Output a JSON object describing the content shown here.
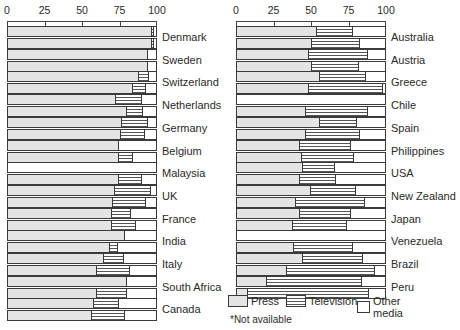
{
  "chart_data": [
    {
      "type": "bar",
      "subtype": "stacked-horizontal-100-percent",
      "title": "",
      "xlabel": "",
      "ylabel": "",
      "xlim": [
        0,
        100
      ],
      "x_ticks": [
        "0",
        "25",
        "50",
        "75",
        "100"
      ],
      "grid": false,
      "note": "Each country has two stacked bars (top and bottom periods); segments: Press, Television, Other media (remainder to 100). null = not available.",
      "series_names": [
        "Press",
        "Television",
        "Other media"
      ],
      "categories": [
        "Denmark",
        "Sweden",
        "Switzerland",
        "Netherlands",
        "Germany",
        "Belgium",
        "Malaysia",
        "UK",
        "France",
        "India",
        "Italy",
        "South Africa",
        "Canada"
      ],
      "rows": [
        {
          "country": "Denmark",
          "top": {
            "press": 96,
            "television": 1,
            "other": 3
          },
          "bottom": {
            "press": 96,
            "television": 1,
            "other": 3
          }
        },
        {
          "country": "Sweden",
          "top": {
            "press": 93,
            "television": 0,
            "other": 7
          },
          "bottom": {
            "press": 93,
            "television": 0,
            "other": 7
          }
        },
        {
          "country": "Switzerland",
          "top": {
            "press": 87,
            "television": 7,
            "other": 6
          },
          "bottom": {
            "press": 83,
            "television": 9,
            "other": 8
          }
        },
        {
          "country": "Netherlands",
          "top": {
            "press": 72,
            "television": 17,
            "other": 11
          },
          "bottom": {
            "press": 79,
            "television": 11,
            "other": 10
          }
        },
        {
          "country": "Germany",
          "top": {
            "press": 76,
            "television": 17,
            "other": 7
          },
          "bottom": {
            "press": 75,
            "television": 16,
            "other": 9
          }
        },
        {
          "country": "Belgium",
          "top": {
            "press": 74,
            "television": 0,
            "other": 26
          },
          "bottom": {
            "press": 74,
            "television": 9,
            "other": 17
          }
        },
        {
          "country": "Malaysia",
          "top": null,
          "bottom": {
            "press": 74,
            "television": 15,
            "other": 11
          }
        },
        {
          "country": "UK",
          "top": {
            "press": 71,
            "television": 24,
            "other": 5
          },
          "bottom": {
            "press": 70,
            "television": 22,
            "other": 8
          }
        },
        {
          "country": "France",
          "top": {
            "press": 69,
            "television": 13,
            "other": 18
          },
          "bottom": {
            "press": 69,
            "television": 16,
            "other": 15
          }
        },
        {
          "country": "India",
          "top": {
            "press": 78,
            "television": 0,
            "other": 22
          },
          "bottom": {
            "press": 68,
            "television": 5,
            "other": 27
          }
        },
        {
          "country": "Italy",
          "top": {
            "press": 64,
            "television": 13,
            "other": 23
          },
          "bottom": {
            "press": 59,
            "television": 22,
            "other": 19
          }
        },
        {
          "country": "South Africa",
          "top": {
            "press": 79,
            "television": 0,
            "other": 21
          },
          "bottom": {
            "press": 59,
            "television": 20,
            "other": 21
          }
        },
        {
          "country": "Canada",
          "top": {
            "press": 57,
            "television": 17,
            "other": 26
          },
          "bottom": {
            "press": 56,
            "television": 22,
            "other": 22
          }
        }
      ]
    },
    {
      "type": "bar",
      "subtype": "stacked-horizontal-100-percent",
      "title": "",
      "xlabel": "",
      "ylabel": "",
      "xlim": [
        0,
        100
      ],
      "x_ticks": [
        "0",
        "25",
        "50",
        "75",
        "100"
      ],
      "grid": false,
      "series_names": [
        "Press",
        "Television",
        "Other media"
      ],
      "categories": [
        "Australia",
        "Austria",
        "Greece",
        "Chile",
        "Spain",
        "Philippines",
        "USA",
        "New Zealand",
        "Japan",
        "Venezuela",
        "Brazil",
        "Peru"
      ],
      "rows": [
        {
          "country": "Australia",
          "top": {
            "press": 53,
            "television": 24,
            "other": 23
          },
          "bottom": {
            "press": 50,
            "television": 32,
            "other": 18
          }
        },
        {
          "country": "Austria",
          "top": {
            "press": 48,
            "television": 39,
            "other": 13
          },
          "bottom": {
            "press": 50,
            "television": 31,
            "other": 19
          }
        },
        {
          "country": "Greece",
          "top": {
            "press": 55,
            "television": 31,
            "other": 14
          },
          "bottom": {
            "press": 48,
            "television": 49,
            "other": 3
          }
        },
        {
          "country": "Chile",
          "top": null,
          "top_note": "*",
          "bottom": {
            "press": 46,
            "television": 41,
            "other": 13
          }
        },
        {
          "country": "Spain",
          "top": {
            "press": 55,
            "television": 25,
            "other": 20
          },
          "bottom": {
            "press": 46,
            "television": 36,
            "other": 18
          }
        },
        {
          "country": "Philippines",
          "top": {
            "press": 42,
            "television": 34,
            "other": 24
          },
          "bottom": {
            "press": 43,
            "television": 35,
            "other": 22
          }
        },
        {
          "country": "USA",
          "top": {
            "press": 44,
            "television": 21,
            "other": 35
          },
          "bottom": {
            "press": 42,
            "television": 24,
            "other": 34
          }
        },
        {
          "country": "New Zealand",
          "top": {
            "press": 49,
            "television": 30,
            "other": 21
          },
          "bottom": {
            "press": 39,
            "television": 46,
            "other": 15
          }
        },
        {
          "country": "Japan",
          "top": {
            "press": 42,
            "television": 34,
            "other": 24
          },
          "bottom": {
            "press": 37,
            "television": 36,
            "other": 27
          }
        },
        {
          "country": "Venezuela",
          "top": null,
          "bottom": {
            "press": 38,
            "television": 39,
            "other": 23
          }
        },
        {
          "country": "Brazil",
          "top": {
            "press": 44,
            "television": 40,
            "other": 16
          },
          "bottom": {
            "press": 33,
            "television": 59,
            "other": 8
          }
        },
        {
          "country": "Peru",
          "top": {
            "press": 20,
            "television": 63,
            "other": 17
          },
          "bottom": {
            "press": 7,
            "television": 81,
            "other": 12
          }
        }
      ]
    }
  ],
  "legend": {
    "items": [
      {
        "key": "press",
        "label": "Press"
      },
      {
        "key": "tv",
        "label": "Television"
      },
      {
        "key": "other",
        "label": "Other media"
      }
    ],
    "position": "bottom-right"
  },
  "footnote": "*Not available",
  "axis": {
    "ticks": [
      "0",
      "25",
      "50",
      "75",
      "100"
    ]
  }
}
